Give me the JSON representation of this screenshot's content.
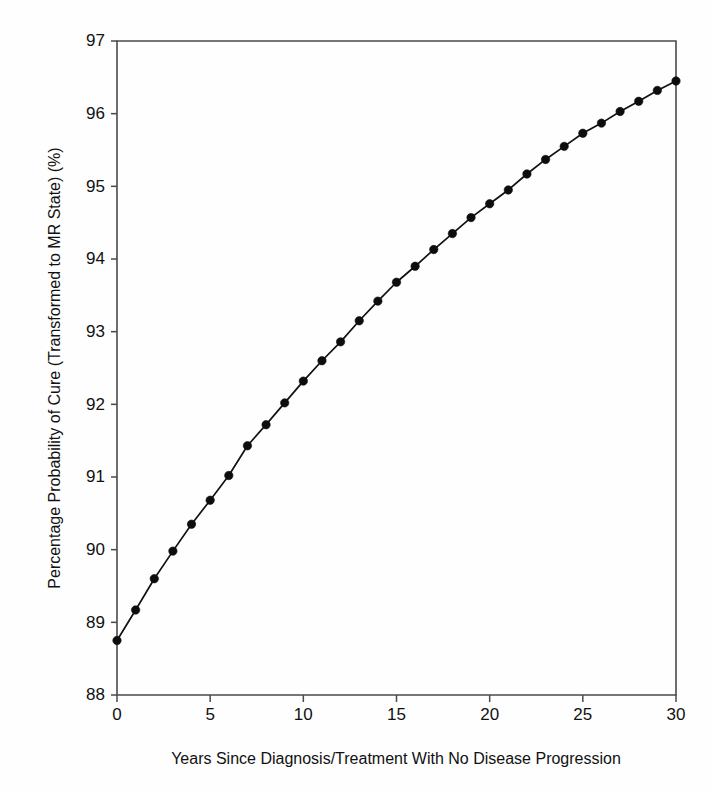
{
  "chart_data": {
    "type": "line",
    "title": "",
    "xlabel": "Years Since Diagnosis/Treatment With No Disease Progression",
    "ylabel": "Percentage Probability of Cure (Transformed to MR State) (%)",
    "xlim": [
      0,
      30
    ],
    "ylim": [
      88,
      97
    ],
    "xticks": [
      0,
      5,
      10,
      15,
      20,
      25,
      30
    ],
    "xtick_labels": [
      "0",
      "5",
      "10",
      "15",
      "20",
      "25",
      "30"
    ],
    "yticks": [
      88,
      89,
      90,
      91,
      92,
      93,
      94,
      95,
      96,
      97
    ],
    "ytick_labels": [
      "88",
      "89",
      "90",
      "91",
      "92",
      "93",
      "94",
      "95",
      "96",
      "97"
    ],
    "grid": false,
    "legend": false,
    "legend_position": "none",
    "marker": "filled-circle",
    "line_color": "#111111",
    "marker_color": "#0d0d0d",
    "axis_color": "#4a4a4a",
    "background_color": "#fefefe",
    "x": [
      0,
      1,
      2,
      3,
      4,
      5,
      6,
      7,
      8,
      9,
      10,
      11,
      12,
      13,
      14,
      15,
      16,
      17,
      18,
      19,
      20,
      21,
      22,
      23,
      24,
      25,
      26,
      27,
      28,
      29,
      30
    ],
    "values": [
      88.75,
      89.17,
      89.6,
      89.98,
      90.35,
      90.68,
      91.02,
      91.43,
      91.72,
      92.02,
      92.32,
      92.6,
      92.86,
      93.15,
      93.42,
      93.68,
      93.9,
      94.13,
      94.35,
      94.57,
      94.76,
      94.95,
      95.17,
      95.37,
      95.55,
      95.73,
      95.87,
      96.03,
      96.17,
      96.32,
      96.45
    ],
    "series": [
      {
        "name": "Probability of cure",
        "values": [
          88.75,
          89.17,
          89.6,
          89.98,
          90.35,
          90.68,
          91.02,
          91.43,
          91.72,
          92.02,
          92.32,
          92.6,
          92.86,
          93.15,
          93.42,
          93.68,
          93.9,
          94.13,
          94.35,
          94.57,
          94.76,
          94.95,
          95.17,
          95.37,
          95.55,
          95.73,
          95.87,
          96.03,
          96.17,
          96.32,
          96.45
        ]
      }
    ]
  }
}
